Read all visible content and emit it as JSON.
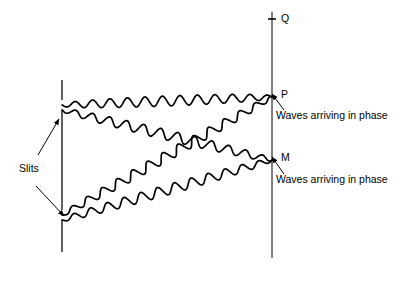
{
  "figure": {
    "kind": "physics-diagram",
    "topic": "double-slit-interference",
    "background_color": "#ffffff",
    "ink_color": "#000000"
  },
  "labels": {
    "q": "Q",
    "p": "P",
    "m": "M",
    "slits": "Slits",
    "caption_p": "Waves arriving in phase",
    "caption_m": "Waves arriving in phase"
  },
  "chart_data": {
    "type": "line",
    "title": "",
    "xlabel": "",
    "ylabel": "",
    "grid": false,
    "legend": "none",
    "barrier": {
      "x": 62,
      "segments": [
        {
          "y_start": 80,
          "y_end": 100
        },
        {
          "y_start": 110,
          "y_end": 210
        },
        {
          "y_start": 220,
          "y_end": 252
        }
      ],
      "slit_gaps": [
        {
          "name": "upper-slit",
          "x": 62,
          "y": 105
        },
        {
          "name": "lower-slit",
          "x": 62,
          "y": 215
        }
      ]
    },
    "screen": {
      "x": 272,
      "y_start": 12,
      "y_end": 258,
      "tick_marks": [
        {
          "name": "q-tick",
          "y": 19,
          "half_width": 4
        }
      ]
    },
    "points": [
      {
        "name": "Q",
        "x": 272,
        "y": 19
      },
      {
        "name": "P",
        "x": 272,
        "y": 97
      },
      {
        "name": "M",
        "x": 272,
        "y": 160
      }
    ],
    "waves": [
      {
        "name": "upper-slit-to-P",
        "source": "upper-slit",
        "target": "P",
        "x_start": 62,
        "y_start": 105,
        "x_end": 272,
        "y_end": 97,
        "amplitude": 5.0,
        "wavelength": 17.5,
        "phase": 0
      },
      {
        "name": "lower-slit-to-P",
        "source": "lower-slit",
        "target": "P",
        "x_start": 62,
        "y_start": 215,
        "x_end": 272,
        "y_end": 97,
        "amplitude": 5.0,
        "wavelength": 17.5,
        "phase": 0
      },
      {
        "name": "upper-slit-to-M",
        "source": "upper-slit",
        "target": "M",
        "x_start": 62,
        "y_start": 110,
        "x_end": 272,
        "y_end": 160,
        "amplitude": 5.0,
        "wavelength": 17.5,
        "phase": 0
      },
      {
        "name": "lower-slit-to-M",
        "source": "lower-slit",
        "target": "M",
        "x_start": 62,
        "y_start": 220,
        "x_end": 272,
        "y_end": 160,
        "amplitude": 5.0,
        "wavelength": 17.5,
        "phase": 0
      }
    ],
    "annotation_arrows": [
      {
        "name": "slits-arrow-upper",
        "x1": 38,
        "y1": 155,
        "x2": 59,
        "y2": 119
      },
      {
        "name": "slits-arrow-lower",
        "x1": 36,
        "y1": 186,
        "x2": 64,
        "y2": 216
      },
      {
        "name": "caption-arrow-p",
        "x1": 284,
        "y1": 110,
        "x2": 272,
        "y2": 94
      },
      {
        "name": "caption-arrow-m",
        "x1": 284,
        "y1": 174,
        "x2": 272,
        "y2": 157
      }
    ]
  }
}
